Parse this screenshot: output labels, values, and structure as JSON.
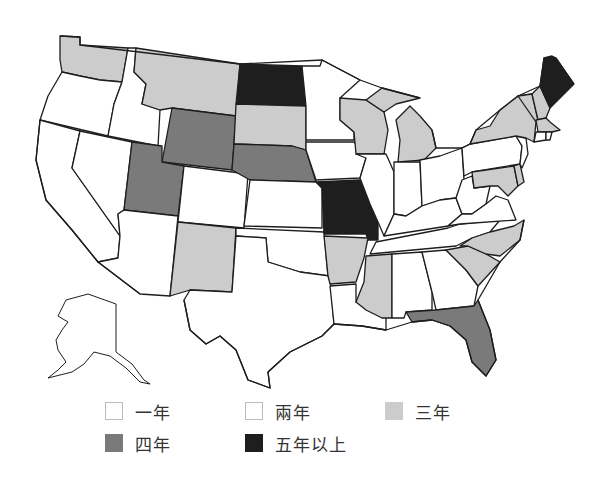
{
  "legend": {
    "items": [
      {
        "label": "一年",
        "color": "#ffffff",
        "border": "#bbbbbb"
      },
      {
        "label": "兩年",
        "color": "#ffffff",
        "border": "#bbbbbb"
      },
      {
        "label": "三年",
        "color": "#cccccc",
        "border": "#cccccc"
      },
      {
        "label": "四年",
        "color": "#7a7a7a",
        "border": "#7a7a7a"
      },
      {
        "label": "五年以上",
        "color": "#1e1e1e",
        "border": "#1e1e1e"
      }
    ]
  },
  "colors": {
    "one_or_two_years": "#ffffff",
    "three_years": "#cccccc",
    "four_years": "#7a7a7a",
    "five_plus_years": "#1e1e1e",
    "border": "#1e1e1e"
  },
  "map": {
    "region": "United States",
    "states": {
      "five_plus_years": [
        "North Dakota",
        "Missouri",
        "Maine"
      ],
      "four_years": [
        "Wyoming",
        "Utah",
        "Nebraska",
        "Florida"
      ],
      "three_years": [
        "Washington",
        "Montana",
        "South Dakota",
        "New Mexico",
        "Arkansas",
        "Mississippi",
        "Wisconsin",
        "Michigan",
        "New York",
        "Vermont",
        "New Hampshire",
        "Massachusetts",
        "Maryland",
        "North Carolina",
        "South Carolina"
      ],
      "one_or_two_years": [
        "Oregon",
        "California",
        "Nevada",
        "Idaho",
        "Arizona",
        "Colorado",
        "Kansas",
        "Oklahoma",
        "Texas",
        "Louisiana",
        "Minnesota",
        "Iowa",
        "Illinois",
        "Indiana",
        "Ohio",
        "Kentucky",
        "Tennessee",
        "Alabama",
        "Georgia",
        "West Virginia",
        "Virginia",
        "Pennsylvania",
        "New Jersey",
        "Delaware",
        "Connecticut",
        "Rhode Island",
        "Alaska",
        "Hawaii"
      ]
    }
  }
}
